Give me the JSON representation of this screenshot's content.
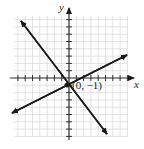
{
  "chart_data": {
    "type": "line",
    "title": "",
    "xlabel": "x",
    "ylabel": "y",
    "xlim": [
      -7.5,
      8
    ],
    "ylim": [
      -8,
      8.5
    ],
    "grid": true,
    "series": [
      {
        "name": "steep line",
        "slope": -1.33,
        "intercept": -1,
        "x": [
          -6.7,
          5.2
        ],
        "y": [
          7.9,
          -7.9
        ]
      },
      {
        "name": "shallow line",
        "slope": 0.5,
        "intercept": -1,
        "x": [
          -7.8,
          8.1
        ],
        "y": [
          -4.9,
          3.3
        ]
      }
    ],
    "annotations": [
      {
        "text": "(0, −1)",
        "x": 0,
        "y": -1
      }
    ]
  },
  "labels": {
    "x_axis": "x",
    "y_axis": "y",
    "point": "(0, −1)"
  },
  "colors": {
    "grid": "#d9d9d9",
    "axis": "#333333",
    "line": "#1a1a1a"
  }
}
